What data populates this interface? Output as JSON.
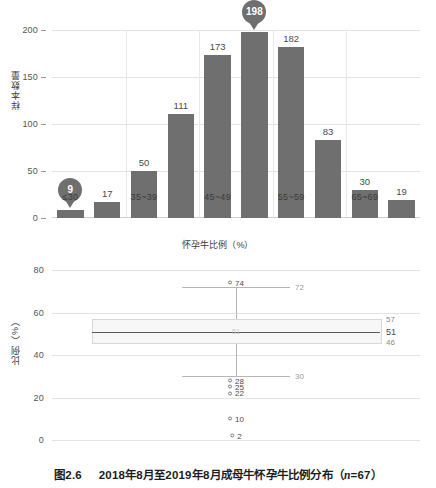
{
  "caption": {
    "number": "图2.6",
    "text": "2018年8月至2019年8月成母牛怀孕牛比例分布（",
    "n_italic": "n",
    "n_value": "=67）"
  },
  "chart_data": [
    {
      "type": "bar",
      "title": "",
      "xlabel": "怀孕牛比例（%）",
      "ylabel": "样本数量",
      "ylim": [
        0,
        200
      ],
      "yticks": [
        0,
        50,
        100,
        150,
        200
      ],
      "grid": true,
      "categories": [
        "≤30",
        "30~34",
        "35~39",
        "40~44",
        "45~49",
        "50~54",
        "55~59",
        "60~64",
        "65~69",
        "≥70"
      ],
      "visible_xticks": [
        "≤30",
        "35~39",
        "45~49",
        "55~59",
        "65~69"
      ],
      "values": [
        9,
        17,
        50,
        111,
        173,
        198,
        182,
        83,
        30,
        19
      ],
      "highlight_markers": [
        {
          "category_index": 0,
          "label": "9"
        },
        {
          "category_index": 5,
          "label": "198"
        }
      ],
      "bar_color": "#6f6f6f"
    },
    {
      "type": "box",
      "title": "",
      "xlabel": "",
      "ylabel": "比例（%）",
      "ylim": [
        0,
        80
      ],
      "yticks": [
        0,
        20,
        40,
        60,
        80
      ],
      "grid": true,
      "box": {
        "q1": 46,
        "median": 51,
        "q3": 57,
        "whisker_low": 30,
        "whisker_high": 72,
        "median_label": "51",
        "q1_label": "46",
        "q3_label": "57",
        "whisker_low_label": "30",
        "whisker_high_label": "72",
        "inbox_label": "51"
      },
      "outliers": [
        {
          "value": 74,
          "label": "74"
        },
        {
          "value": 28,
          "label": "28"
        },
        {
          "value": 25,
          "label": "25"
        },
        {
          "value": 22,
          "label": "22"
        },
        {
          "value": 10,
          "label": "10"
        },
        {
          "value": 2,
          "label": "2"
        }
      ],
      "box_fill": "#f7f7f7",
      "line_color": "#5a5a5a"
    }
  ]
}
